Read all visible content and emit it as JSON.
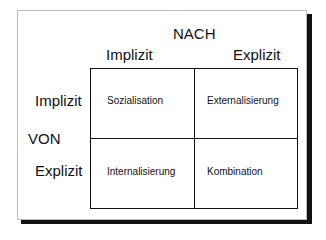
{
  "header": {
    "top_label": "NACH"
  },
  "columns": [
    {
      "label": "Implizit"
    },
    {
      "label": "Explizit"
    }
  ],
  "side_label": "VON",
  "rows": [
    {
      "label": "Implizit"
    },
    {
      "label": "Explizit"
    }
  ],
  "cells": [
    [
      "Sozialisation",
      "Externalisierung"
    ],
    [
      "Internalisierung",
      "Kombination"
    ]
  ]
}
